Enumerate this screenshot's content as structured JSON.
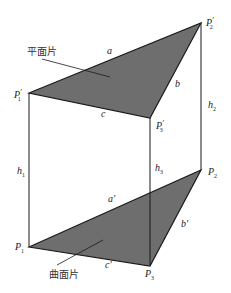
{
  "figure": {
    "colors": {
      "fill": "#6e6e6e",
      "stroke": "#1a1a1a",
      "background": "#ffffff"
    },
    "top_triangle": {
      "annotation": "平面片",
      "vertices": [
        {
          "name": "P'1",
          "base": "P",
          "prime": "′",
          "sub": "1",
          "x": 29,
          "y": 93
        },
        {
          "name": "P'2",
          "base": "P",
          "prime": "′",
          "sub": "2",
          "x": 201,
          "y": 23
        },
        {
          "name": "P'3",
          "base": "P",
          "prime": "′",
          "sub": "3",
          "x": 150,
          "y": 118
        }
      ],
      "edges": [
        {
          "label": "a",
          "from": "P'1",
          "to": "P'2"
        },
        {
          "label": "b",
          "from": "P'2",
          "to": "P'3"
        },
        {
          "label": "c",
          "from": "P'1",
          "to": "P'3"
        }
      ]
    },
    "bottom_triangle": {
      "annotation": "曲面片",
      "vertices": [
        {
          "name": "P1",
          "base": "P",
          "prime": "",
          "sub": "1",
          "x": 29,
          "y": 247
        },
        {
          "name": "P2",
          "base": "P",
          "prime": "",
          "sub": "2",
          "x": 201,
          "y": 170
        },
        {
          "name": "P3",
          "base": "P",
          "prime": "",
          "sub": "3",
          "x": 150,
          "y": 266
        }
      ],
      "edges": [
        {
          "label": "a′",
          "from": "P1",
          "to": "P2"
        },
        {
          "label": "b′",
          "from": "P2",
          "to": "P3"
        },
        {
          "label": "c′",
          "from": "P1",
          "to": "P3"
        }
      ]
    },
    "heights": [
      {
        "label": "h",
        "sub": "1",
        "from": "P'1",
        "to": "P1"
      },
      {
        "label": "h",
        "sub": "2",
        "from": "P'2",
        "to": "P2"
      },
      {
        "label": "h",
        "sub": "3",
        "from": "P'3",
        "to": "P3"
      }
    ]
  }
}
